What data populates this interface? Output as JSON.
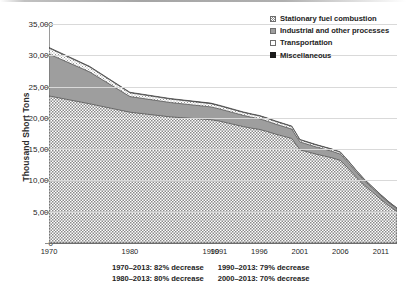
{
  "chart_data": {
    "type": "area",
    "title": "",
    "subtitle": "",
    "xlabel": "",
    "ylabel": "Thousand Short Tons",
    "stacked": true,
    "grid": true,
    "legend_position": "top-right",
    "ylim": [
      0,
      35000
    ],
    "ytick_labels": [
      "35,000",
      "30,000",
      "25,000",
      "20,000",
      "15,000",
      "10,000",
      "5,000",
      "0"
    ],
    "ytick_values": [
      35000,
      30000,
      25000,
      20000,
      15000,
      10000,
      5000,
      0
    ],
    "xtick_labels": [
      "1970",
      "1980",
      "1990",
      "1991",
      "1996",
      "2001",
      "2006",
      "2011"
    ],
    "xtick_values": [
      1970,
      1980,
      1990,
      1991,
      1996,
      2001,
      2006,
      2011
    ],
    "xlim": [
      1970,
      2013
    ],
    "x": [
      1970,
      1975,
      1980,
      1985,
      1990,
      1991,
      1992,
      1993,
      1994,
      1995,
      1996,
      1997,
      1998,
      1999,
      2000,
      2001,
      2002,
      2003,
      2004,
      2005,
      2006,
      2007,
      2008,
      2009,
      2010,
      2011,
      2012,
      2013
    ],
    "series": [
      {
        "name": "Transportation",
        "pattern": "checkerboard",
        "color": "#b0b0b0",
        "values": [
          23500,
          22250,
          20900,
          20150,
          19700,
          19500,
          19200,
          18900,
          18600,
          18350,
          18150,
          17800,
          17400,
          17050,
          16700,
          14900,
          14550,
          14200,
          13900,
          13600,
          13200,
          11900,
          10500,
          9200,
          8100,
          7000,
          5950,
          5050
        ]
      },
      {
        "name": "Industrial and other processes",
        "pattern": "solid",
        "color": "#9e9e9e",
        "values": [
          6700,
          5100,
          2500,
          2300,
          2050,
          1950,
          1900,
          1850,
          1800,
          1750,
          1700,
          1650,
          1600,
          1550,
          1500,
          1250,
          1200,
          1150,
          1100,
          1050,
          1000,
          900,
          800,
          700,
          620,
          540,
          470,
          400
        ]
      },
      {
        "name": "Stationary fuel combustion",
        "pattern": "hatched",
        "color": "#f2f2f2",
        "values": [
          950,
          800,
          600,
          550,
          520,
          500,
          490,
          480,
          470,
          460,
          450,
          440,
          430,
          420,
          410,
          340,
          330,
          320,
          310,
          300,
          290,
          260,
          230,
          200,
          175,
          150,
          130,
          110
        ]
      },
      {
        "name": "Miscellaneous",
        "pattern": "solid",
        "color": "#1a1a1a",
        "values": [
          100,
          95,
          90,
          88,
          85,
          84,
          83,
          82,
          81,
          80,
          79,
          78,
          77,
          76,
          75,
          70,
          68,
          66,
          64,
          62,
          60,
          55,
          50,
          45,
          42,
          38,
          34,
          30
        ]
      }
    ],
    "annotations": [
      "1970–2013: 82% decrease",
      "1990–2013: 79% decrease",
      "1980–2013: 80% decrease",
      "2000–2013: 70% decrease"
    ]
  },
  "legend": {
    "items": [
      {
        "label": "Stationary fuel combustion",
        "swatch": "stationary-swatch-icon"
      },
      {
        "label": "Industrial and other processes",
        "swatch": "industrial-swatch-icon"
      },
      {
        "label": "Transportation",
        "swatch": "transportation-swatch-icon"
      },
      {
        "label": "Miscellaneous",
        "swatch": "miscellaneous-swatch-icon"
      }
    ]
  }
}
